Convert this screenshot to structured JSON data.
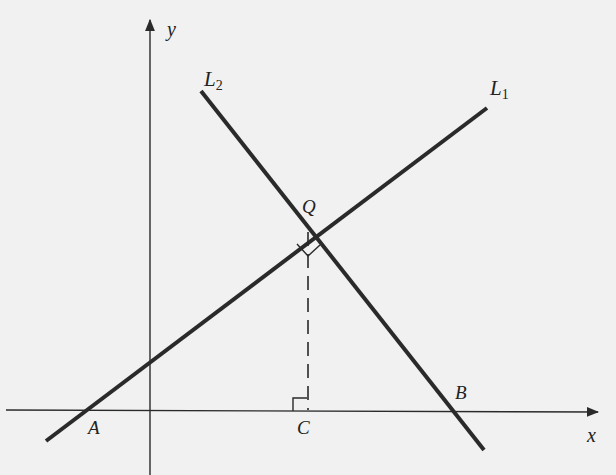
{
  "diagram": {
    "type": "coordinate-geometry",
    "axes": {
      "x_label": "x",
      "y_label": "y"
    },
    "lines": [
      {
        "name": "L",
        "subscript": "1",
        "description": "line rising left to right through A and Q"
      },
      {
        "name": "L",
        "subscript": "2",
        "description": "line falling left to right through Q and B"
      }
    ],
    "points": {
      "A": "A",
      "B": "B",
      "C": "C",
      "Q": "Q"
    },
    "annotations": {
      "right_angle_at_Q": "L1 perpendicular to L2",
      "right_angle_at_C": "QC perpendicular to x-axis",
      "dashed_segment": "QC"
    }
  },
  "colors": {
    "background": "#f1f1f1",
    "ink": "#2a2a2a"
  }
}
